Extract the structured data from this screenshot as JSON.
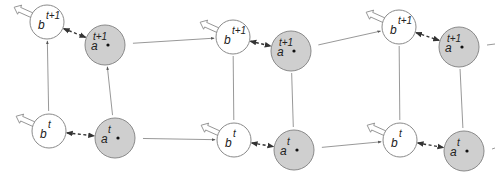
{
  "diagram": {
    "type": "dynamic-graph",
    "columns": [
      {
        "id": "col-1",
        "nodes": [
          {
            "id": "b-next",
            "symbol": "b",
            "superscript": "t+1",
            "kind": "b"
          },
          {
            "id": "a-next",
            "symbol": "a",
            "superscript": "t+1",
            "kind": "a"
          },
          {
            "id": "b-now",
            "symbol": "b",
            "superscript": "t",
            "kind": "b"
          },
          {
            "id": "a-now",
            "symbol": "a",
            "superscript": "t",
            "kind": "a"
          }
        ],
        "vertical_arrows": true
      },
      {
        "id": "col-2",
        "nodes": [
          {
            "id": "b-next",
            "symbol": "b",
            "superscript": "t+1",
            "kind": "b"
          },
          {
            "id": "a-next",
            "symbol": "a",
            "superscript": "t+1",
            "kind": "a"
          },
          {
            "id": "b-now",
            "symbol": "b",
            "superscript": "t",
            "kind": "b"
          },
          {
            "id": "a-now",
            "symbol": "a",
            "superscript": "t",
            "kind": "a"
          }
        ],
        "vertical_arrows": false
      },
      {
        "id": "col-3",
        "nodes": [
          {
            "id": "b-next",
            "symbol": "b",
            "superscript": "t+1",
            "kind": "b"
          },
          {
            "id": "a-next",
            "symbol": "a",
            "superscript": "t+1",
            "kind": "a"
          },
          {
            "id": "b-now",
            "symbol": "b",
            "superscript": "t",
            "kind": "b"
          },
          {
            "id": "a-now",
            "symbol": "a",
            "superscript": "t",
            "kind": "a"
          }
        ],
        "vertical_arrows": false
      }
    ],
    "colors": {
      "b_fill": "#ffffff",
      "a_fill": "#cfcfcf",
      "stroke": "#8a8a8a",
      "dashed": "#333333"
    }
  }
}
